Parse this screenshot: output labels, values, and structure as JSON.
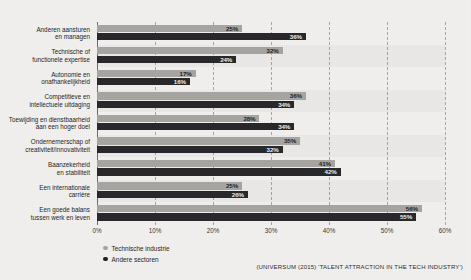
{
  "chart_data": {
    "type": "bar",
    "orientation": "horizontal",
    "title": "",
    "xlabel": "",
    "ylabel": "",
    "xlim": [
      0,
      60
    ],
    "grid": true,
    "legend_position": "bottom-left",
    "categories": [
      "Anderen aansturen\nen managen",
      "Technische of\nfunctionele expertise",
      "Autonomie en\nonafhankelijkheid",
      "Competitieve en\nintellectuele uitdaging",
      "Toewijding en dienstbaarheid\naan een hoger doel",
      "Ondernemerschap of\ncreativiteit/innovativiteit",
      "Baanzekerheid\nen stabiliteit",
      "Een internationale\ncarrière",
      "Een goede balans\ntussen werk en leven"
    ],
    "category_lines": [
      [
        "Anderen aansturen",
        "en managen"
      ],
      [
        "Technische of",
        "functionele expertise"
      ],
      [
        "Autonomie en",
        "onafhankelijkheid"
      ],
      [
        "Competitieve en",
        "intellectuele uitdaging"
      ],
      [
        "Toewijding en dienstbaarheid",
        "aan een hoger doel"
      ],
      [
        "Ondernemerschap of",
        "creativiteit/innovativiteit"
      ],
      [
        "Baanzekerheid",
        "en stabiliteit"
      ],
      [
        "Een internationale",
        "carrière"
      ],
      [
        "Een goede balans",
        "tussen werk en leven"
      ]
    ],
    "series": [
      {
        "name": "Technische industrie",
        "color": "#a6a5a2",
        "values": [
          25,
          32,
          17,
          36,
          28,
          35,
          41,
          25,
          56
        ],
        "labels": [
          "25%",
          "32%",
          "17%",
          "36%",
          "28%",
          "35%",
          "41%",
          "25%",
          "56%"
        ]
      },
      {
        "name": "Andere sectoren",
        "color": "#27272a",
        "values": [
          36,
          24,
          16,
          34,
          34,
          32,
          42,
          26,
          55
        ],
        "labels": [
          "36%",
          "24%",
          "16%",
          "34%",
          "34%",
          "32%",
          "42%",
          "26%",
          "55%"
        ]
      }
    ],
    "x_ticks": [
      0,
      10,
      20,
      30,
      40,
      50,
      60
    ],
    "x_tick_labels": [
      "0%",
      "10%",
      "20%",
      "30%",
      "40%",
      "50%",
      "60%"
    ]
  },
  "legend": {
    "items": [
      {
        "label": "Technische industrie",
        "color": "#a6a5a2"
      },
      {
        "label": "Andere sectoren",
        "color": "#1f1f22"
      }
    ]
  },
  "source": {
    "text": "(UNIVERSUM (2015) 'TALENT ATTRACTION IN THE TECH INDUSTRY')"
  },
  "colors": {
    "background": "#f2f1ef",
    "series_light": "#a6a5a2",
    "series_dark": "#27272a",
    "gridline": "#9b9a97",
    "text": "#1b1b1d"
  }
}
